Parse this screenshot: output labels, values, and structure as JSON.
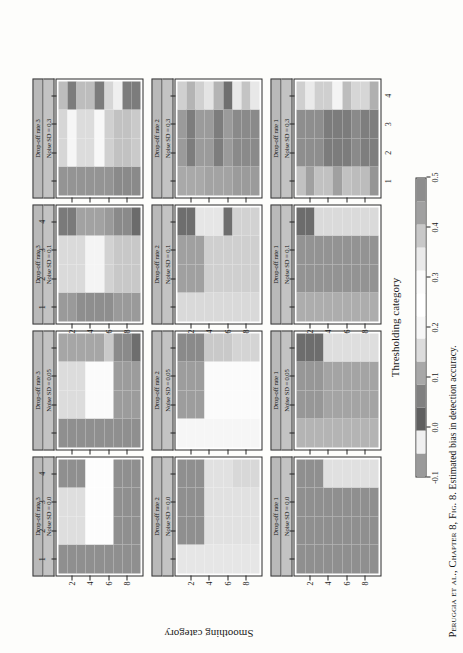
{
  "figure": {
    "caption_prefix": "Peruggia et al.,",
    "caption_chapter": " Chapter 8, Fig. 8.",
    "caption_text": " Estimated bias in detection accuracy.",
    "x_axis_title": "Thresholding category",
    "y_axis_title": "Smoothing category",
    "x_tick_labels": [
      "1",
      "2",
      "3",
      "4"
    ],
    "y_tick_labels": [
      "2",
      "4",
      "6",
      "8"
    ],
    "y_tick_rows": [
      2,
      4,
      6,
      8
    ]
  },
  "strips": {
    "dropoff": [
      "Drop-off rate 3",
      "Drop-off rate 2",
      "Drop-off rate 1"
    ],
    "noise": [
      "Noise SD = 0.0",
      "Noise SD = 0.05",
      "Noise SD = 0.1",
      "Noise SD = 0.3"
    ]
  },
  "legend": {
    "title": "",
    "min": -0.1,
    "max": 0.5,
    "tick_values": [
      "-0.1",
      "0.0",
      "0.1",
      "0.2",
      "0.3",
      "0.4",
      "0.5"
    ],
    "colors": [
      "#9a9a9a",
      "#f0f0f0",
      "#5f5f5f",
      "#808080",
      "#a8a8a8",
      "#dcdcdc",
      "#f7f7f7",
      "#ffffff",
      "#fbfbfb",
      "#eaeaea",
      "#c8c8c8",
      "#a0a0a0",
      "#8d8d8d"
    ]
  },
  "chart_data": {
    "type": "heatmap",
    "title": "Estimated bias in detection accuracy",
    "xlabel": "Thresholding category",
    "ylabel": "Smoothing category",
    "x_categories": [
      1,
      2,
      3,
      4
    ],
    "y_categories": [
      1,
      2,
      3,
      4,
      5,
      6,
      7,
      8,
      9
    ],
    "zlim": [
      -0.1,
      0.5
    ],
    "grid": false,
    "legend_position": "bottom",
    "panel_rows": [
      "Drop-off rate 3",
      "Drop-off rate 2",
      "Drop-off rate 1"
    ],
    "panel_cols": [
      "Noise SD = 0.0",
      "Noise SD = 0.05",
      "Noise SD = 0.1",
      "Noise SD = 0.3"
    ],
    "panels": [
      {
        "row": "Drop-off rate 3",
        "col": "Noise SD = 0.0",
        "cells": [
          [
            "#8f8f8f",
            "#dedede",
            "#dedede",
            "#8f8f8f"
          ],
          [
            "#8f8f8f",
            "#dedede",
            "#dedede",
            "#8f8f8f"
          ],
          [
            "#8f8f8f",
            "#dedede",
            "#dedede",
            "#8f8f8f"
          ],
          [
            "#8f8f8f",
            "#fdfdfd",
            "#fdfdfd",
            "#fdfdfd"
          ],
          [
            "#8f8f8f",
            "#fdfdfd",
            "#fdfdfd",
            "#fdfdfd"
          ],
          [
            "#8f8f8f",
            "#fdfdfd",
            "#fdfdfd",
            "#fdfdfd"
          ],
          [
            "#8f8f8f",
            "#8f8f8f",
            "#8f8f8f",
            "#8f8f8f"
          ],
          [
            "#8f8f8f",
            "#8f8f8f",
            "#8f8f8f",
            "#8f8f8f"
          ],
          [
            "#8f8f8f",
            "#8f8f8f",
            "#8f8f8f",
            "#8f8f8f"
          ]
        ]
      },
      {
        "row": "Drop-off rate 3",
        "col": "Noise SD = 0.05",
        "cells": [
          [
            "#8f8f8f",
            "#dcdcdc",
            "#dcdcdc",
            "#a6a6a6"
          ],
          [
            "#8f8f8f",
            "#dcdcdc",
            "#dcdcdc",
            "#a6a6a6"
          ],
          [
            "#8f8f8f",
            "#dcdcdc",
            "#dcdcdc",
            "#a6a6a6"
          ],
          [
            "#8f8f8f",
            "#fbfbfb",
            "#fbfbfb",
            "#a6a6a6"
          ],
          [
            "#8f8f8f",
            "#fbfbfb",
            "#fbfbfb",
            "#a6a6a6"
          ],
          [
            "#8f8f8f",
            "#fbfbfb",
            "#fbfbfb",
            "#c9c9c9"
          ],
          [
            "#8f8f8f",
            "#9c9c9c",
            "#9c9c9c",
            "#8a8a8a"
          ],
          [
            "#8f8f8f",
            "#9c9c9c",
            "#9c9c9c",
            "#8a8a8a"
          ],
          [
            "#8f8f8f",
            "#9c9c9c",
            "#9c9c9c",
            "#6e6e6e"
          ]
        ]
      },
      {
        "row": "Drop-off rate 3",
        "col": "Noise SD = 0.1",
        "cells": [
          [
            "#9a9a9a",
            "#dadada",
            "#dadada",
            "#7a7a7a"
          ],
          [
            "#9a9a9a",
            "#dadada",
            "#dadada",
            "#7a7a7a"
          ],
          [
            "#8e8e8e",
            "#dadada",
            "#dadada",
            "#a2a2a2"
          ],
          [
            "#8e8e8e",
            "#f4f4f4",
            "#f4f4f4",
            "#a2a2a2"
          ],
          [
            "#8e8e8e",
            "#f4f4f4",
            "#f4f4f4",
            "#a2a2a2"
          ],
          [
            "#8e8e8e",
            "#d2d2d2",
            "#d2d2d2",
            "#9a9a9a"
          ],
          [
            "#9a9a9a",
            "#c8c8c8",
            "#c8c8c8",
            "#8a8a8a"
          ],
          [
            "#9a9a9a",
            "#c8c8c8",
            "#c8c8c8",
            "#8a8a8a"
          ],
          [
            "#9a9a9a",
            "#c8c8c8",
            "#c8c8c8",
            "#6b6b6b"
          ]
        ]
      },
      {
        "row": "Drop-off rate 3",
        "col": "Noise SD = 0.3",
        "cells": [
          [
            "#949494",
            "#d6d6d6",
            "#d6d6d6",
            "#bdbdbd"
          ],
          [
            "#949494",
            "#f6f6f6",
            "#f6f6f6",
            "#7c7c7c"
          ],
          [
            "#949494",
            "#dcdcdc",
            "#dcdcdc",
            "#bdbdbd"
          ],
          [
            "#949494",
            "#dcdcdc",
            "#dcdcdc",
            "#bdbdbd"
          ],
          [
            "#949494",
            "#f8f8f8",
            "#f8f8f8",
            "#7c7c7c"
          ],
          [
            "#949494",
            "#d0d0d0",
            "#d0d0d0",
            "#d6d6d6"
          ],
          [
            "#8a8a8a",
            "#c2c2c2",
            "#c2c2c2",
            "#efefef"
          ],
          [
            "#8a8a8a",
            "#c2c2c2",
            "#c2c2c2",
            "#7c7c7c"
          ],
          [
            "#8a8a8a",
            "#cacaca",
            "#cacaca",
            "#7c7c7c"
          ]
        ]
      },
      {
        "row": "Drop-off rate 2",
        "col": "Noise SD = 0.0",
        "cells": [
          [
            "#e6e6e6",
            "#8f8f8f",
            "#8f8f8f",
            "#8f8f8f"
          ],
          [
            "#e6e6e6",
            "#8f8f8f",
            "#8f8f8f",
            "#8f8f8f"
          ],
          [
            "#e6e6e6",
            "#8f8f8f",
            "#8f8f8f",
            "#8f8f8f"
          ],
          [
            "#e6e6e6",
            "#e1e1e1",
            "#e1e1e1",
            "#e1e1e1"
          ],
          [
            "#e6e6e6",
            "#e1e1e1",
            "#e1e1e1",
            "#e1e1e1"
          ],
          [
            "#e6e6e6",
            "#e1e1e1",
            "#e1e1e1",
            "#e1e1e1"
          ],
          [
            "#e6e6e6",
            "#e1e1e1",
            "#e1e1e1",
            "#d8d8d8"
          ],
          [
            "#e6e6e6",
            "#e1e1e1",
            "#e1e1e1",
            "#d8d8d8"
          ],
          [
            "#e6e6e6",
            "#e1e1e1",
            "#e1e1e1",
            "#d8d8d8"
          ]
        ]
      },
      {
        "row": "Drop-off rate 2",
        "col": "Noise SD = 0.05",
        "cells": [
          [
            "#f6f6f6",
            "#9d9d9d",
            "#9d9d9d",
            "#8a8a8a"
          ],
          [
            "#f6f6f6",
            "#9d9d9d",
            "#9d9d9d",
            "#8a8a8a"
          ],
          [
            "#f6f6f6",
            "#9d9d9d",
            "#9d9d9d",
            "#8a8a8a"
          ],
          [
            "#f6f6f6",
            "#fbfbfb",
            "#fbfbfb",
            "#c9c9c9"
          ],
          [
            "#f6f6f6",
            "#fbfbfb",
            "#fbfbfb",
            "#c9c9c9"
          ],
          [
            "#f6f6f6",
            "#fbfbfb",
            "#fbfbfb",
            "#c9c9c9"
          ],
          [
            "#f6f6f6",
            "#fbfbfb",
            "#fbfbfb",
            "#d4d4d4"
          ],
          [
            "#f6f6f6",
            "#fbfbfb",
            "#fbfbfb",
            "#d4d4d4"
          ],
          [
            "#f6f6f6",
            "#fbfbfb",
            "#fbfbfb",
            "#d4d4d4"
          ]
        ]
      },
      {
        "row": "Drop-off rate 2",
        "col": "Noise SD = 0.1",
        "cells": [
          [
            "#d9d9d9",
            "#a0a0a0",
            "#a0a0a0",
            "#6e6e6e"
          ],
          [
            "#d9d9d9",
            "#a0a0a0",
            "#a0a0a0",
            "#6e6e6e"
          ],
          [
            "#d9d9d9",
            "#a0a0a0",
            "#a0a0a0",
            "#e6e6e6"
          ],
          [
            "#d9d9d9",
            "#cfcfcf",
            "#cfcfcf",
            "#e6e6e6"
          ],
          [
            "#d9d9d9",
            "#cfcfcf",
            "#cfcfcf",
            "#e6e6e6"
          ],
          [
            "#d9d9d9",
            "#cfcfcf",
            "#cfcfcf",
            "#6e6e6e"
          ],
          [
            "#d9d9d9",
            "#cfcfcf",
            "#cfcfcf",
            "#d2d2d2"
          ],
          [
            "#d9d9d9",
            "#cfcfcf",
            "#cfcfcf",
            "#d2d2d2"
          ],
          [
            "#d9d9d9",
            "#cfcfcf",
            "#cfcfcf",
            "#d2d2d2"
          ]
        ]
      },
      {
        "row": "Drop-off rate 2",
        "col": "Noise SD = 0.3",
        "cells": [
          [
            "#a9a9a9",
            "#9b9b9b",
            "#9b9b9b",
            "#d0d0d0"
          ],
          [
            "#a9a9a9",
            "#7d7d7d",
            "#7d7d7d",
            "#b4b4b4"
          ],
          [
            "#a9a9a9",
            "#9b9b9b",
            "#9b9b9b",
            "#d0d0d0"
          ],
          [
            "#a3a3a3",
            "#9b9b9b",
            "#9b9b9b",
            "#e4e4e4"
          ],
          [
            "#a3a3a3",
            "#7d7d7d",
            "#7d7d7d",
            "#b4b4b4"
          ],
          [
            "#a3a3a3",
            "#9b9b9b",
            "#9b9b9b",
            "#6f6f6f"
          ],
          [
            "#9b9b9b",
            "#8a8a8a",
            "#8a8a8a",
            "#e8e8e8"
          ],
          [
            "#9b9b9b",
            "#8a8a8a",
            "#8a8a8a",
            "#c4c4c4"
          ],
          [
            "#9b9b9b",
            "#8a8a8a",
            "#8a8a8a",
            "#e8e8e8"
          ]
        ]
      },
      {
        "row": "Drop-off rate 1",
        "col": "Noise SD = 0.0",
        "cells": [
          [
            "#8f8f8f",
            "#8f8f8f",
            "#8f8f8f",
            "#8f8f8f"
          ],
          [
            "#8f8f8f",
            "#8f8f8f",
            "#8f8f8f",
            "#8f8f8f"
          ],
          [
            "#8f8f8f",
            "#8f8f8f",
            "#8f8f8f",
            "#8f8f8f"
          ],
          [
            "#8f8f8f",
            "#8f8f8f",
            "#8f8f8f",
            "#e0e0e0"
          ],
          [
            "#8f8f8f",
            "#8f8f8f",
            "#8f8f8f",
            "#e0e0e0"
          ],
          [
            "#8f8f8f",
            "#8f8f8f",
            "#8f8f8f",
            "#e0e0e0"
          ],
          [
            "#8f8f8f",
            "#8f8f8f",
            "#8f8f8f",
            "#e0e0e0"
          ],
          [
            "#8f8f8f",
            "#8f8f8f",
            "#8f8f8f",
            "#e0e0e0"
          ],
          [
            "#8f8f8f",
            "#8f8f8f",
            "#8f8f8f",
            "#e0e0e0"
          ]
        ]
      },
      {
        "row": "Drop-off rate 1",
        "col": "Noise SD = 0.05",
        "cells": [
          [
            "#b4b4b4",
            "#979797",
            "#979797",
            "#6d6d6d"
          ],
          [
            "#b4b4b4",
            "#979797",
            "#979797",
            "#6d6d6d"
          ],
          [
            "#b4b4b4",
            "#979797",
            "#979797",
            "#6d6d6d"
          ],
          [
            "#b4b4b4",
            "#a4a4a4",
            "#a4a4a4",
            "#dedede"
          ],
          [
            "#b4b4b4",
            "#a4a4a4",
            "#a4a4a4",
            "#dedede"
          ],
          [
            "#b4b4b4",
            "#a4a4a4",
            "#a4a4a4",
            "#dedede"
          ],
          [
            "#b4b4b4",
            "#a4a4a4",
            "#a4a4a4",
            "#dedede"
          ],
          [
            "#b4b4b4",
            "#a4a4a4",
            "#a4a4a4",
            "#dedede"
          ],
          [
            "#b4b4b4",
            "#a4a4a4",
            "#a4a4a4",
            "#dedede"
          ]
        ]
      },
      {
        "row": "Drop-off rate 1",
        "col": "Noise SD = 0.1",
        "cells": [
          [
            "#adadad",
            "#939393",
            "#939393",
            "#6c6c6c"
          ],
          [
            "#adadad",
            "#939393",
            "#939393",
            "#6c6c6c"
          ],
          [
            "#adadad",
            "#939393",
            "#939393",
            "#dadada"
          ],
          [
            "#adadad",
            "#939393",
            "#939393",
            "#dadada"
          ],
          [
            "#adadad",
            "#939393",
            "#939393",
            "#dadada"
          ],
          [
            "#adadad",
            "#939393",
            "#939393",
            "#dadada"
          ],
          [
            "#adadad",
            "#939393",
            "#939393",
            "#dadada"
          ],
          [
            "#adadad",
            "#939393",
            "#939393",
            "#dadada"
          ],
          [
            "#adadad",
            "#939393",
            "#939393",
            "#dadada"
          ]
        ]
      },
      {
        "row": "Drop-off rate 1",
        "col": "Noise SD = 0.3",
        "cells": [
          [
            "#c1c1c1",
            "#8e8e8e",
            "#8e8e8e",
            "#cfcfcf"
          ],
          [
            "#a0a0a0",
            "#8e8e8e",
            "#8e8e8e",
            "#eaeaea"
          ],
          [
            "#c1c1c1",
            "#8e8e8e",
            "#8e8e8e",
            "#cfcfcf"
          ],
          [
            "#c1c1c1",
            "#7c7c7c",
            "#7c7c7c",
            "#cfcfcf"
          ],
          [
            "#a0a0a0",
            "#7c7c7c",
            "#7c7c7c",
            "#f4f4f4"
          ],
          [
            "#c1c1c1",
            "#7c7c7c",
            "#7c7c7c",
            "#bdbdbd"
          ],
          [
            "#bcbcbc",
            "#8a8a8a",
            "#8a8a8a",
            "#d6d6d6"
          ],
          [
            "#bcbcbc",
            "#7e7e7e",
            "#7e7e7e",
            "#d6d6d6"
          ],
          [
            "#959595",
            "#7e7e7e",
            "#7e7e7e",
            "#b0b0b0"
          ]
        ]
      }
    ]
  }
}
